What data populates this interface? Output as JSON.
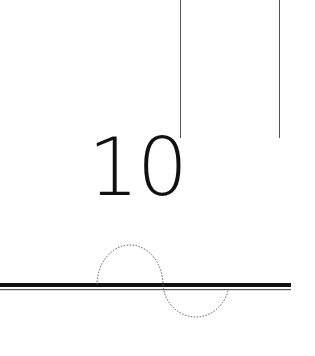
{
  "figure": {
    "number_label": "10",
    "colors": {
      "thick_line": "#111111",
      "thin_line": "#555555",
      "dotted": "#555555",
      "vertical_lines": "#555555",
      "background": "#ffffff"
    }
  }
}
